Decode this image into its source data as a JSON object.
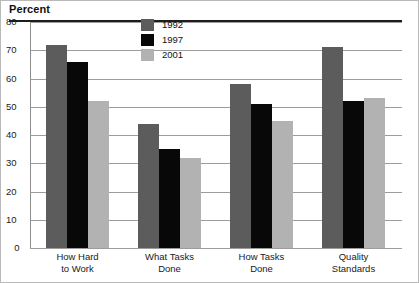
{
  "chart_data": {
    "type": "bar",
    "title": "Percent",
    "xlabel": "",
    "ylabel": "Percent",
    "ylim": [
      0,
      80
    ],
    "yticks": [
      "0",
      "10",
      "20",
      "30",
      "40",
      "50",
      "60",
      "70",
      "80"
    ],
    "grid": true,
    "legend_position": "top-center",
    "categories": [
      "How Hard to Work",
      "What Tasks Done",
      "How Tasks Done",
      "Quality Standards"
    ],
    "category_lines": [
      [
        "How Hard",
        "to Work"
      ],
      [
        "What Tasks",
        "Done"
      ],
      [
        "How Tasks",
        "Done"
      ],
      [
        "Quality",
        "Standards"
      ]
    ],
    "series": [
      {
        "name": "1992",
        "color": "#5c5c5c",
        "values": [
          72,
          44,
          58,
          71
        ]
      },
      {
        "name": "1997",
        "color": "#080808",
        "values": [
          66,
          35,
          51,
          52
        ]
      },
      {
        "name": "2001",
        "color": "#b2b2b2",
        "values": [
          52,
          32,
          45,
          53
        ]
      }
    ]
  },
  "legend": {
    "items": [
      {
        "label": "1992",
        "swatch": "dark-gray"
      },
      {
        "label": "1997",
        "swatch": "black"
      },
      {
        "label": "2001",
        "swatch": "light-gray"
      }
    ]
  }
}
